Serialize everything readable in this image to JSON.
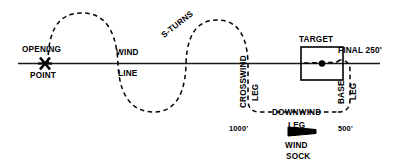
{
  "diagram": {
    "labels": {
      "opening": "OPENING",
      "point": "POINT",
      "wind": "WIND",
      "line": "LINE",
      "s_turns": "S-TURNS",
      "crosswind": "CROSSWIND",
      "crosswind_leg": "LEG",
      "downwind": "DOWNWIND",
      "downwind_leg": "LEG",
      "base": "BASE",
      "base_leg": "LEG",
      "target": "TARGET",
      "final": "FINAL 250'",
      "altitude_1000": "1000'",
      "altitude_500": "500'",
      "wind_sock_1": "WIND",
      "wind_sock_2": "SOCK"
    },
    "colors": {
      "ink": "#000000",
      "line": "#1a1a1a",
      "background": "#ffffff"
    },
    "icons": {
      "opening_marker": "x-cross-marker",
      "target_marker": "filled-dot",
      "wind_sock": "windsock-triangle"
    }
  }
}
